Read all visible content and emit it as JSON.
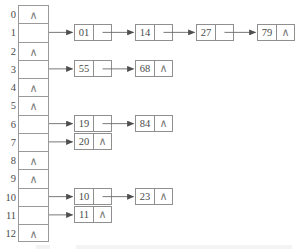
{
  "diagram": {
    "null_symbol": "∧",
    "colors": {
      "border": "#8f8f8f",
      "table_border": "#9a9a9a",
      "text": "#4a4a4a",
      "null_text": "#7c7c7c",
      "arrow": "#5a5a5a",
      "background": "#ffffff"
    },
    "buckets": [
      {
        "index": "0",
        "empty": true,
        "chain": []
      },
      {
        "index": "1",
        "empty": false,
        "chain": [
          "01",
          "14",
          "27",
          "79"
        ]
      },
      {
        "index": "2",
        "empty": true,
        "chain": []
      },
      {
        "index": "3",
        "empty": false,
        "chain": [
          "55",
          "68"
        ]
      },
      {
        "index": "4",
        "empty": true,
        "chain": []
      },
      {
        "index": "5",
        "empty": true,
        "chain": []
      },
      {
        "index": "6",
        "empty": false,
        "chain": [
          "19",
          "84"
        ]
      },
      {
        "index": "7",
        "empty": false,
        "chain": [
          "20"
        ]
      },
      {
        "index": "8",
        "empty": true,
        "chain": []
      },
      {
        "index": "9",
        "empty": true,
        "chain": []
      },
      {
        "index": "10",
        "empty": false,
        "chain": [
          "10",
          "23"
        ]
      },
      {
        "index": "11",
        "empty": false,
        "chain": [
          "11"
        ]
      },
      {
        "index": "12",
        "empty": true,
        "chain": []
      }
    ]
  }
}
